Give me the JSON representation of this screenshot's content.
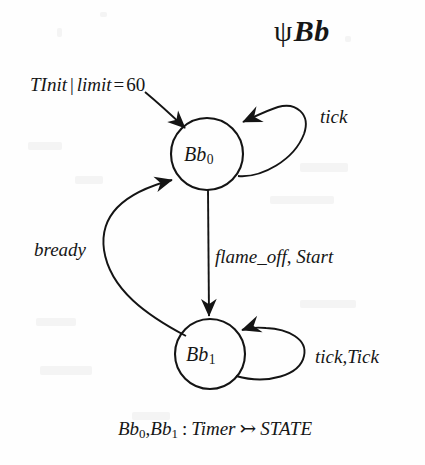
{
  "diagram": {
    "type": "state-transition-diagram",
    "title": {
      "symbol": "ψ",
      "name": "Bb",
      "full": "ψBb"
    },
    "nodes": [
      {
        "id": "Bb0",
        "base": "Bb",
        "sub": "0",
        "label": "Bb₀",
        "cx": 207,
        "cy": 154,
        "r": 36
      },
      {
        "id": "Bb1",
        "base": "Bb",
        "sub": "1",
        "label": "Bb₁",
        "cx": 210,
        "cy": 354,
        "r": 35
      }
    ],
    "edges": [
      {
        "id": "init",
        "kind": "initial-entry",
        "from": null,
        "to": "Bb0",
        "label": "TInit | limit = 60",
        "label_parts": {
          "event": "TInit",
          "separator": "|",
          "guard_var": "limit",
          "operator": "=",
          "guard_value": "60"
        }
      },
      {
        "id": "bb0-self",
        "kind": "self-loop",
        "from": "Bb0",
        "to": "Bb0",
        "label": "tick"
      },
      {
        "id": "bb0-to-bb1",
        "kind": "transition",
        "from": "Bb0",
        "to": "Bb1",
        "label": "flame_off, Start",
        "label_parts": {
          "first": "flame_off",
          "comma": ",",
          "second": "Start"
        }
      },
      {
        "id": "bb1-to-bb0",
        "kind": "transition",
        "from": "Bb1",
        "to": "Bb0",
        "label": "bready"
      },
      {
        "id": "bb1-self",
        "kind": "self-loop",
        "from": "Bb1",
        "to": "Bb1",
        "label": "tick, Tick",
        "label_parts": {
          "first": "tick",
          "comma": ",",
          "second": "Tick"
        }
      }
    ],
    "caption": {
      "full": "Bb₀, Bb₁ : Timer ↣ STATE",
      "lhs_first": "Bb",
      "lhs_first_sub": "0",
      "lhs_comma": ",",
      "lhs_second": "Bb",
      "lhs_second_sub": "1",
      "colon": ":",
      "domain": "Timer",
      "arrow": "↣",
      "codomain": "STATE"
    },
    "colors": {
      "ink": "#141414",
      "paper": "#fefefe"
    }
  }
}
